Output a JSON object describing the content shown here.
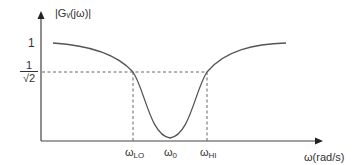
{
  "diagram": {
    "type": "band-stop frequency response",
    "y_axis_label": "|Gᵥ(jω)|",
    "x_axis_label": "ω(rad/s)",
    "y_ticks": {
      "one": "1",
      "half_power_num": "1",
      "half_power_den": "√2"
    },
    "x_ticks": [
      {
        "symbol": "ω",
        "sub": "LO"
      },
      {
        "symbol": "ω",
        "sub": "0"
      },
      {
        "symbol": "ω",
        "sub": "HI"
      }
    ],
    "colors": {
      "axis": "#444444",
      "curve": "#555555",
      "dashed": "#666666",
      "text": "#333333"
    }
  }
}
